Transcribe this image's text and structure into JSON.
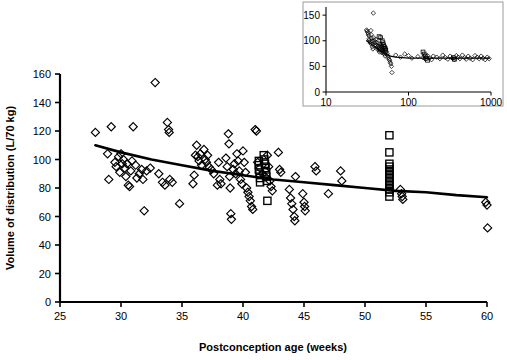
{
  "figure": {
    "background_color": "#ffffff",
    "ink_color": "#000000",
    "inset_frame_color": "#9a9a9a"
  },
  "chart_data": {
    "type": "scatter",
    "title": "",
    "xlabel": "Postconception age (weeks)",
    "ylabel": "Volume of distribution (L/70 kg)",
    "xlim": [
      25,
      60
    ],
    "ylim": [
      0,
      160
    ],
    "xticks": [
      25,
      30,
      35,
      40,
      45,
      50,
      55,
      60
    ],
    "yticks": [
      0,
      20,
      40,
      60,
      80,
      100,
      120,
      140,
      160
    ],
    "grid": false,
    "legend": [],
    "series": [
      {
        "name": "diamond-observations",
        "marker": "diamond",
        "filled": false,
        "points": [
          [
            27.9,
            119
          ],
          [
            28.9,
            104
          ],
          [
            29.0,
            86
          ],
          [
            29.2,
            123
          ],
          [
            29.5,
            98
          ],
          [
            29.6,
            95
          ],
          [
            29.8,
            102
          ],
          [
            29.9,
            91
          ],
          [
            30.0,
            104
          ],
          [
            30.1,
            97
          ],
          [
            30.2,
            100
          ],
          [
            30.3,
            94
          ],
          [
            30.4,
            88
          ],
          [
            30.5,
            97
          ],
          [
            30.6,
            82
          ],
          [
            30.7,
            81
          ],
          [
            30.8,
            92
          ],
          [
            30.9,
            99
          ],
          [
            31.0,
            123
          ],
          [
            31.2,
            96
          ],
          [
            31.3,
            87
          ],
          [
            31.5,
            90
          ],
          [
            31.7,
            93
          ],
          [
            31.8,
            86
          ],
          [
            31.9,
            64
          ],
          [
            32.1,
            92
          ],
          [
            32.4,
            94
          ],
          [
            32.8,
            154
          ],
          [
            33.1,
            90
          ],
          [
            33.4,
            84
          ],
          [
            33.6,
            82
          ],
          [
            33.8,
            126
          ],
          [
            33.9,
            121
          ],
          [
            33.95,
            119
          ],
          [
            34.0,
            86
          ],
          [
            34.2,
            84
          ],
          [
            34.8,
            69
          ],
          [
            35.9,
            83
          ],
          [
            36.0,
            89
          ],
          [
            36.1,
            103
          ],
          [
            36.2,
            110
          ],
          [
            36.3,
            102
          ],
          [
            36.4,
            99
          ],
          [
            36.5,
            104
          ],
          [
            36.6,
            96
          ],
          [
            36.8,
            107
          ],
          [
            36.9,
            100
          ],
          [
            37.0,
            98
          ],
          [
            37.1,
            103
          ],
          [
            37.2,
            95
          ],
          [
            37.4,
            93
          ],
          [
            37.6,
            90
          ],
          [
            37.9,
            82
          ],
          [
            38.0,
            98
          ],
          [
            38.1,
            86
          ],
          [
            38.2,
            83
          ],
          [
            38.6,
            101
          ],
          [
            38.7,
            95
          ],
          [
            38.8,
            118
          ],
          [
            38.85,
            111
          ],
          [
            38.9,
            88
          ],
          [
            38.95,
            80
          ],
          [
            39.0,
            62
          ],
          [
            39.05,
            58
          ],
          [
            39.2,
            93
          ],
          [
            39.3,
            97
          ],
          [
            39.4,
            90
          ],
          [
            39.5,
            104
          ],
          [
            39.6,
            99
          ],
          [
            39.7,
            92
          ],
          [
            39.8,
            86
          ],
          [
            39.9,
            83
          ],
          [
            40.0,
            106
          ],
          [
            40.1,
            98
          ],
          [
            40.2,
            91
          ],
          [
            40.3,
            80
          ],
          [
            40.4,
            77
          ],
          [
            40.5,
            74
          ],
          [
            40.6,
            71
          ],
          [
            40.7,
            67
          ],
          [
            40.8,
            65
          ],
          [
            41.0,
            121
          ],
          [
            41.1,
            120
          ],
          [
            41.2,
            98
          ],
          [
            41.4,
            94
          ],
          [
            41.6,
            90
          ],
          [
            41.8,
            88
          ],
          [
            42.0,
            103
          ],
          [
            42.1,
            95
          ],
          [
            42.2,
            85
          ],
          [
            42.3,
            81
          ],
          [
            42.4,
            78
          ],
          [
            42.9,
            105
          ],
          [
            43.0,
            93
          ],
          [
            43.1,
            91
          ],
          [
            43.8,
            79
          ],
          [
            43.9,
            73
          ],
          [
            44.0,
            69
          ],
          [
            44.1,
            65
          ],
          [
            44.2,
            60
          ],
          [
            44.25,
            57
          ],
          [
            44.3,
            88
          ],
          [
            44.9,
            76
          ],
          [
            45.0,
            70
          ],
          [
            45.05,
            67
          ],
          [
            45.1,
            64
          ],
          [
            45.9,
            95
          ],
          [
            46.0,
            92
          ],
          [
            47.0,
            76
          ],
          [
            48.0,
            92
          ],
          [
            48.1,
            85
          ],
          [
            52.9,
            79
          ],
          [
            53.0,
            76
          ],
          [
            53.05,
            74
          ],
          [
            53.1,
            72
          ],
          [
            59.9,
            70
          ],
          [
            60.0,
            68
          ],
          [
            60.05,
            52
          ]
        ]
      },
      {
        "name": "square-observations",
        "marker": "square",
        "filled": false,
        "points": [
          [
            41.3,
            99
          ],
          [
            41.3,
            96
          ],
          [
            41.3,
            93
          ],
          [
            41.35,
            90
          ],
          [
            41.4,
            87
          ],
          [
            41.4,
            84
          ],
          [
            41.7,
            103
          ],
          [
            41.75,
            100
          ],
          [
            41.8,
            97
          ],
          [
            41.85,
            94
          ],
          [
            41.9,
            91
          ],
          [
            41.9,
            88
          ],
          [
            41.95,
            85
          ],
          [
            42.0,
            71
          ],
          [
            52.0,
            117
          ],
          [
            52.0,
            105
          ],
          [
            52.0,
            97
          ],
          [
            52.0,
            95
          ],
          [
            52.0,
            93
          ],
          [
            52.0,
            91
          ],
          [
            52.0,
            89
          ],
          [
            52.0,
            87
          ],
          [
            52.0,
            85
          ],
          [
            52.0,
            83
          ],
          [
            52.0,
            81
          ],
          [
            52.0,
            79
          ],
          [
            52.0,
            77
          ],
          [
            52.0,
            74
          ]
        ]
      }
    ],
    "trend_line": {
      "name": "fitted-curve",
      "points": [
        [
          27.9,
          110
        ],
        [
          30,
          105
        ],
        [
          32.5,
          100
        ],
        [
          35,
          96
        ],
        [
          37.5,
          92
        ],
        [
          40,
          89
        ],
        [
          42.5,
          86
        ],
        [
          45,
          84
        ],
        [
          47.5,
          82
        ],
        [
          50,
          80
        ],
        [
          52.5,
          78
        ],
        [
          55,
          77
        ],
        [
          57.5,
          75
        ],
        [
          60,
          73.5
        ]
      ]
    }
  },
  "inset_chart_data": {
    "type": "scatter",
    "title": "",
    "xlabel": "",
    "ylabel": "",
    "xscale": "log",
    "xlim": [
      10,
      1000
    ],
    "ylim": [
      0,
      160
    ],
    "xticks": [
      10,
      100,
      1000
    ],
    "xtick_labels": [
      "10",
      "100",
      "1000"
    ],
    "yticks": [
      0,
      50,
      100,
      150
    ],
    "grid": false,
    "series": [
      {
        "name": "inset-diamond-observations",
        "marker": "diamond",
        "filled": false,
        "points": [
          [
            31,
            121
          ],
          [
            31.5,
            119
          ],
          [
            32,
            116
          ],
          [
            32.5,
            113
          ],
          [
            33,
            110
          ],
          [
            33.2,
            104
          ],
          [
            33.5,
            101
          ],
          [
            34,
            98
          ],
          [
            34.5,
            95
          ],
          [
            35,
            120
          ],
          [
            35.2,
            112
          ],
          [
            35.5,
            105
          ],
          [
            36,
            99
          ],
          [
            36.2,
            93
          ],
          [
            36.5,
            88
          ],
          [
            37,
            84
          ],
          [
            37.5,
            154
          ],
          [
            38,
            106
          ],
          [
            38.5,
            100
          ],
          [
            39,
            96
          ],
          [
            39.5,
            92
          ],
          [
            40,
            103
          ],
          [
            40.5,
            97
          ],
          [
            41,
            91
          ],
          [
            41.5,
            87
          ],
          [
            42,
            83
          ],
          [
            42.5,
            96
          ],
          [
            43,
            90
          ],
          [
            43.5,
            86
          ],
          [
            44,
            82
          ],
          [
            44.5,
            78
          ],
          [
            45,
            94
          ],
          [
            45.5,
            89
          ],
          [
            46,
            85
          ],
          [
            46.5,
            81
          ],
          [
            47,
            77
          ],
          [
            47.5,
            92
          ],
          [
            48,
            88
          ],
          [
            48.5,
            84
          ],
          [
            49,
            80
          ],
          [
            49.5,
            76
          ],
          [
            50,
            86
          ],
          [
            50.5,
            82
          ],
          [
            51,
            78
          ],
          [
            51.5,
            74
          ],
          [
            52,
            70
          ],
          [
            53,
            84
          ],
          [
            54,
            79
          ],
          [
            55,
            75
          ],
          [
            56,
            71
          ],
          [
            57,
            67
          ],
          [
            58,
            64
          ],
          [
            59,
            62
          ],
          [
            60,
            58
          ],
          [
            61,
            55
          ],
          [
            62,
            50
          ],
          [
            63,
            38
          ],
          [
            70,
            72
          ],
          [
            80,
            68
          ],
          [
            90,
            74
          ],
          [
            100,
            71
          ],
          [
            110,
            66
          ],
          [
            130,
            69
          ],
          [
            150,
            67
          ],
          [
            160,
            64
          ],
          [
            170,
            71
          ],
          [
            180,
            66
          ],
          [
            190,
            63
          ],
          [
            200,
            70
          ],
          [
            220,
            68
          ],
          [
            240,
            65
          ],
          [
            260,
            72
          ],
          [
            280,
            67
          ],
          [
            300,
            64
          ],
          [
            320,
            70
          ],
          [
            340,
            66
          ],
          [
            360,
            63
          ],
          [
            380,
            71
          ],
          [
            400,
            68
          ],
          [
            420,
            65
          ],
          [
            450,
            72
          ],
          [
            480,
            67
          ],
          [
            500,
            64
          ],
          [
            530,
            70
          ],
          [
            560,
            66
          ],
          [
            600,
            63
          ],
          [
            640,
            71
          ],
          [
            680,
            68
          ],
          [
            720,
            65
          ],
          [
            760,
            70
          ],
          [
            800,
            66
          ],
          [
            850,
            63
          ],
          [
            900,
            68
          ],
          [
            950,
            65
          ]
        ]
      },
      {
        "name": "inset-square-observations",
        "marker": "square",
        "filled": false,
        "points": [
          [
            44,
            108
          ],
          [
            46,
            106
          ],
          [
            48,
            100
          ],
          [
            49,
            96
          ],
          [
            50,
            92
          ],
          [
            51,
            88
          ],
          [
            52,
            85
          ],
          [
            53,
            82
          ],
          [
            150,
            78
          ],
          [
            155,
            74
          ],
          [
            160,
            70
          ],
          [
            165,
            66
          ],
          [
            170,
            62
          ],
          [
            350,
            67
          ],
          [
            360,
            64
          ]
        ]
      }
    ],
    "trend_line": {
      "name": "inset-fitted-curve",
      "points": [
        [
          31,
          100
        ],
        [
          35,
          94
        ],
        [
          40,
          87
        ],
        [
          45,
          81
        ],
        [
          50,
          76
        ],
        [
          55,
          73
        ],
        [
          60,
          70
        ],
        [
          70,
          68
        ],
        [
          85,
          67
        ],
        [
          100,
          66
        ],
        [
          150,
          66
        ],
        [
          200,
          66
        ],
        [
          300,
          66
        ],
        [
          500,
          66
        ],
        [
          700,
          66
        ],
        [
          960,
          66
        ]
      ]
    }
  }
}
